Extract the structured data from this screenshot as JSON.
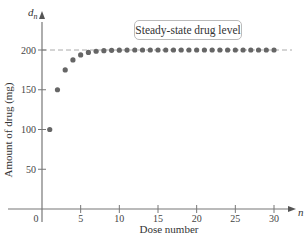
{
  "chart_data": {
    "type": "scatter",
    "title": "",
    "xlabel": "Dose number",
    "ylabel": "Amount of drug (mg)",
    "x_var": "n",
    "y_var": "d",
    "y_var_sub": "n",
    "xlim": [
      0,
      30
    ],
    "ylim": [
      0,
      200
    ],
    "x_ticks": [
      0,
      5,
      10,
      15,
      20,
      25,
      30
    ],
    "y_ticks": [
      50,
      100,
      150,
      200
    ],
    "grid": false,
    "legend": null,
    "annotation": {
      "text": "Steady-state drug level",
      "reference_line_y": 200,
      "style": "dashed"
    },
    "series": [
      {
        "name": "d_n",
        "x": [
          1,
          2,
          3,
          4,
          5,
          6,
          7,
          8,
          9,
          10,
          11,
          12,
          13,
          14,
          15,
          16,
          17,
          18,
          19,
          20,
          21,
          22,
          23,
          24,
          25,
          26,
          27,
          28,
          29,
          30
        ],
        "values": [
          100,
          150,
          175,
          187.5,
          193.8,
          196.9,
          198.4,
          199.2,
          199.6,
          199.8,
          199.9,
          200,
          200,
          200,
          200,
          200,
          200,
          200,
          200,
          200,
          200,
          200,
          200,
          200,
          200,
          200,
          200,
          200,
          200,
          200
        ]
      }
    ],
    "colors": {
      "points": "#666666",
      "axis": "#777777",
      "refline": "#aaaaaa"
    }
  }
}
